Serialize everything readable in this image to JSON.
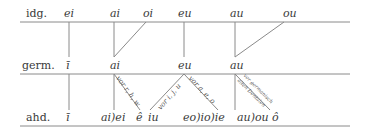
{
  "rows": {
    "idg": {
      "label": "idg.",
      "vowels": [
        "ei",
        "ai",
        "oi",
        "eu",
        "au",
        "ou"
      ]
    },
    "germ": {
      "label": "germ.",
      "vowels": [
        "ī",
        "ai",
        "eu",
        "au"
      ]
    },
    "ahd": {
      "label": "ahd.",
      "vowels": [
        "ī",
        "ai)ei",
        "ê",
        "iu",
        "eo)io)ie",
        "au)ou",
        "ô"
      ]
    }
  },
  "conditions": {
    "ai_to_e": "vor r, h, w",
    "eu_to_iu": "vor i, j, u",
    "eu_to_eo": "vor a, e, o",
    "au_to_o_line1": "vor germanisch",
    "au_to_o_line2": "alten Dentalen"
  },
  "colors": {
    "line": "#8a8a8a",
    "text": "#3a3a3a"
  }
}
